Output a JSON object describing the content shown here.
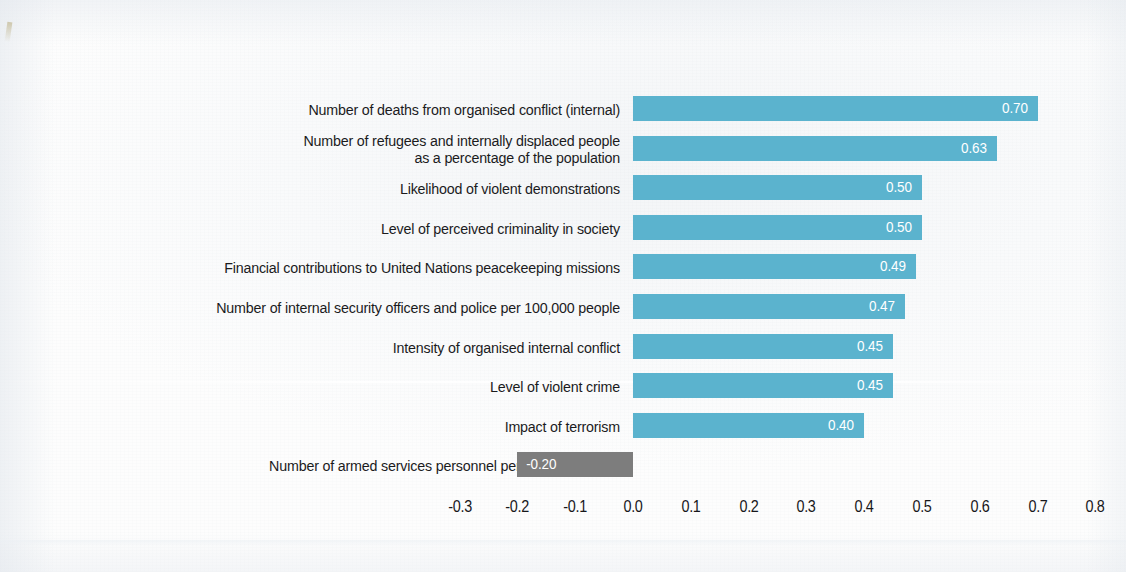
{
  "chart_data": {
    "type": "bar",
    "orientation": "horizontal",
    "title": "",
    "subtitle": "",
    "xlabel": "",
    "ylabel": "",
    "xlim": [
      -0.3,
      0.8
    ],
    "xticks": [
      "-0.3",
      "-0.2",
      "-0.1",
      "0.0",
      "0.1",
      "0.2",
      "0.3",
      "0.4",
      "0.5",
      "0.6",
      "0.7",
      "0.8"
    ],
    "xtick_values": [
      -0.3,
      -0.2,
      -0.1,
      0.0,
      0.1,
      0.2,
      0.3,
      0.4,
      0.5,
      0.6,
      0.7,
      0.8
    ],
    "grid": false,
    "legend": "none",
    "bar_color_positive": "#5bb3ce",
    "bar_color_negative": "#7d7d7d",
    "value_label_color": "#ffffff",
    "categories": [
      "Number of deaths from organised conflict (internal)",
      "Number of refugees and internally displaced people\nas a percentage of the population",
      "Likelihood of violent demonstrations",
      "Level of perceived criminality in society",
      "Financial contributions to United Nations peacekeeping missions",
      "Number of internal security officers and police per 100,000 people",
      "Intensity of organised internal conflict",
      "Level of violent crime",
      "Impact of terrorism",
      "Number of armed services personnel per 100,000 people"
    ],
    "values": [
      0.7,
      0.63,
      0.5,
      0.5,
      0.49,
      0.47,
      0.45,
      0.45,
      0.4,
      -0.2
    ],
    "value_labels": [
      "0.70",
      "0.63",
      "0.50",
      "0.50",
      "0.49",
      "0.47",
      "0.45",
      "0.45",
      "0.40",
      "-0.20"
    ]
  }
}
